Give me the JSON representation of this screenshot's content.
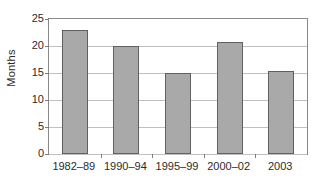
{
  "chart_data": {
    "type": "bar",
    "title": "",
    "xlabel": "",
    "ylabel": "Months",
    "categories": [
      "1982–89",
      "1990–94",
      "1995–99",
      "2000–02",
      "2003"
    ],
    "values": [
      23.0,
      20.0,
      15.0,
      20.8,
      15.3
    ],
    "ylim": [
      0,
      25
    ],
    "ytick_labels": [
      "0",
      "5",
      "10",
      "15",
      "20",
      "25"
    ],
    "ytick_values": [
      0,
      5,
      10,
      15,
      20,
      25
    ],
    "grid": "horizontal",
    "legend": "none",
    "series": [
      {
        "name": "Months",
        "values": [
          23.0,
          20.0,
          15.0,
          20.8,
          15.3
        ]
      }
    ],
    "colors": {
      "bar_fill": "#a9a9a9",
      "bar_border": "#606060",
      "gridline": "#c0c0c0",
      "frame": "#8a8a8a",
      "text": "#2b2b2b",
      "background": "#ffffff"
    }
  }
}
